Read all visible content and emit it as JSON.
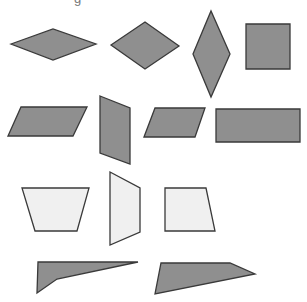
{
  "title_fragment": "g",
  "colors": {
    "dark_fill": "#8f8f8f",
    "light_fill": "#f0f0f0",
    "stroke": "#3a3a3a",
    "background": "#ffffff"
  },
  "shapes": [
    {
      "name": "rhombus-wide",
      "fill": "dark",
      "points": "11,44 53,29 96,44 53,60"
    },
    {
      "name": "rhombus-medium",
      "fill": "dark",
      "points": "111,45 145,22 179,46 145,69"
    },
    {
      "name": "rhombus-tall",
      "fill": "dark",
      "points": "193,54 211,11 230,54 211,97"
    },
    {
      "name": "square",
      "fill": "dark",
      "points": "246,24 290,24 290,69 246,69"
    },
    {
      "name": "parallelogram-left",
      "fill": "dark",
      "points": "8,136 21,107 87,107 73,136"
    },
    {
      "name": "parallelogram-vertical",
      "fill": "dark",
      "points": "100,96 130,108 130,164 100,153"
    },
    {
      "name": "parallelogram-small",
      "fill": "dark",
      "points": "144,137 155,108 205,108 195,137"
    },
    {
      "name": "rectangle",
      "fill": "dark",
      "points": "216,109 300,109 300,142 216,142"
    },
    {
      "name": "trapezoid-isosceles",
      "fill": "light",
      "points": "22,188 89,188 77,231 35,231"
    },
    {
      "name": "trapezoid-vertical",
      "fill": "light",
      "points": "110,172 140,188 140,232 110,245"
    },
    {
      "name": "trapezoid-right",
      "fill": "light",
      "points": "165,188 206,188 215,231 165,231"
    },
    {
      "name": "concave-quadrilateral",
      "fill": "dark",
      "points": "38,262 138,262 57,279 37,293"
    },
    {
      "name": "irregular-quadrilateral",
      "fill": "dark",
      "points": "161,263 230,263 255,274 155,294"
    }
  ]
}
